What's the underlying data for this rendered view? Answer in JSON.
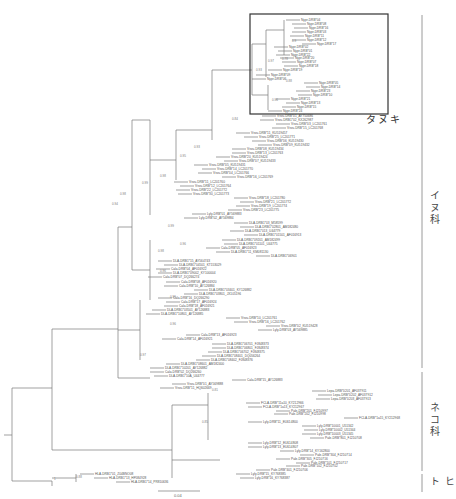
{
  "figure": {
    "type": "phylogenetic-tree",
    "highlight_box": {
      "label": "タヌキ",
      "x": 250,
      "y": 14,
      "w": 138,
      "h": 100
    },
    "groups": [
      {
        "label": "イヌ科",
        "y1": 15,
        "y2": 368,
        "label_y": 190
      },
      {
        "label": "ネコ科",
        "y1": 372,
        "y2": 471,
        "label_y": 402
      },
      {
        "label": "ヒト",
        "y1": 474,
        "y2": 492,
        "label_y": 476
      }
    ],
    "scale_bar": {
      "label": "0.04",
      "x1": 158,
      "x2": 200,
      "y": 491
    }
  },
  "leaves": [
    {
      "label": "Nypr-DRB*04",
      "x": 300,
      "y": 20
    },
    {
      "label": "Nypr-DRB*08",
      "x": 306,
      "y": 24
    },
    {
      "label": "Nypr-DRB*16",
      "x": 308,
      "y": 28
    },
    {
      "label": "Nypr-DRB*03",
      "x": 306,
      "y": 32
    },
    {
      "label": "Nypr-DRB*11",
      "x": 304,
      "y": 36
    },
    {
      "label": "Nypr-DRB*12",
      "x": 306,
      "y": 40
    },
    {
      "label": "Nypr-DRB*17",
      "x": 316,
      "y": 44
    },
    {
      "label": "Nypr-DRB*02",
      "x": 288,
      "y": 47
    },
    {
      "label": "Nypr-DRB*01",
      "x": 292,
      "y": 51
    },
    {
      "label": "Nypr-DRB*22",
      "x": 290,
      "y": 55
    },
    {
      "label": "Nypr-DRB*20",
      "x": 294,
      "y": 58
    },
    {
      "label": "Nypr-DRB*07",
      "x": 296,
      "y": 62
    },
    {
      "label": "Nypr-DRB*18",
      "x": 298,
      "y": 66
    },
    {
      "label": "Nypr-DRB*19",
      "x": 282,
      "y": 70
    },
    {
      "label": "Nypr-DRB*09",
      "x": 270,
      "y": 75
    },
    {
      "label": "Nypr-DRB*06",
      "x": 266,
      "y": 79
    },
    {
      "label": "Nypr-DRB*05",
      "x": 318,
      "y": 83
    },
    {
      "label": "Nypr-DRB*14",
      "x": 320,
      "y": 87
    },
    {
      "label": "Nypr-DRB*23",
      "x": 310,
      "y": 91
    },
    {
      "label": "Nypr-DRB*10",
      "x": 312,
      "y": 95
    },
    {
      "label": "Nypr-DRB*21",
      "x": 290,
      "y": 99
    },
    {
      "label": "Nypr-DRB*13",
      "x": 300,
      "y": 103
    },
    {
      "label": "Nypr-DRB*15",
      "x": 296,
      "y": 107
    },
    {
      "label": "Nypr-DRB*24",
      "x": 282,
      "y": 111
    },
    {
      "label": "Vvvu-DRB*01_AY750686",
      "x": 276,
      "y": 116
    },
    {
      "label": "Vvvu-DRB1*02_KX262987",
      "x": 274,
      "y": 120
    },
    {
      "label": "Vvvu-DRB*03_LC201761",
      "x": 290,
      "y": 124
    },
    {
      "label": "Vvvu-DRB*15_LC201768",
      "x": 286,
      "y": 128
    },
    {
      "label": "Vvvu-DRB*11_KU519457",
      "x": 250,
      "y": 133
    },
    {
      "label": "Vvvu-DRB*25_LC201771",
      "x": 258,
      "y": 137
    },
    {
      "label": "Vvvu-DRB*06_KU519430",
      "x": 266,
      "y": 141
    },
    {
      "label": "Vvvu-DRB*09_KU519432",
      "x": 272,
      "y": 145
    },
    {
      "label": "Vvvu-DRB*08_KU519434",
      "x": 246,
      "y": 149
    },
    {
      "label": "Vvvu-DRB*13_LC201763",
      "x": 246,
      "y": 153
    },
    {
      "label": "Vvvu-DRB*20_KU519424",
      "x": 230,
      "y": 157
    },
    {
      "label": "Vvvu-DRB*07_KU519433",
      "x": 238,
      "y": 161
    },
    {
      "label": "Vvvu-DRB*05_KU519431",
      "x": 208,
      "y": 165
    },
    {
      "label": "Vvvu-DRB*14_LC201770",
      "x": 216,
      "y": 169
    },
    {
      "label": "Vvvu-DRB*04_LC201766",
      "x": 212,
      "y": 173
    },
    {
      "label": "Vvvu-DRB*16_LC201769",
      "x": 236,
      "y": 177
    },
    {
      "label": "Vvvu-DRB*11_LC201760",
      "x": 188,
      "y": 182
    },
    {
      "label": "Vvvu-DRB*12_LC201764",
      "x": 194,
      "y": 186
    },
    {
      "label": "Vvvu-DRB*22_LC201772",
      "x": 190,
      "y": 190
    },
    {
      "label": "Vvvu-DRB*30_LC201773",
      "x": 192,
      "y": 194
    },
    {
      "label": "Vvvu-DRB*18_LC201780",
      "x": 248,
      "y": 198
    },
    {
      "label": "Vvvu-DRB*21_LC201772",
      "x": 254,
      "y": 202
    },
    {
      "label": "Vvvu-DRB*19_LC201774",
      "x": 250,
      "y": 206
    },
    {
      "label": "Vvvu-DRB*23_LC201775",
      "x": 242,
      "y": 210
    },
    {
      "label": "Lyly-DRB*01_AY569883",
      "x": 206,
      "y": 214
    },
    {
      "label": "Lyly-DRB*02_AY569884",
      "x": 198,
      "y": 218
    },
    {
      "label": "DLA-DRB1*03_M58599",
      "x": 248,
      "y": 223
    },
    {
      "label": "DLA-DRB1*02801_AM182480",
      "x": 254,
      "y": 227
    },
    {
      "label": "DLA-DRB1*013_U44779",
      "x": 244,
      "y": 231
    },
    {
      "label": "DLA-DRB1*01501_AF016913",
      "x": 258,
      "y": 235
    },
    {
      "label": "DLA-DRB1*09201_AM182499",
      "x": 236,
      "y": 240
    },
    {
      "label": "DLA-DRB1*01101_U44775",
      "x": 238,
      "y": 244
    },
    {
      "label": "Cala-DRB*05_AF016923",
      "x": 220,
      "y": 248
    },
    {
      "label": "DLA-DRB1*11_KM081130",
      "x": 230,
      "y": 252
    },
    {
      "label": "DLA-DRB1*06901",
      "x": 270,
      "y": 256
    },
    {
      "label": "DLA-DRB1*15_AY564743",
      "x": 172,
      "y": 261
    },
    {
      "label": "DLA-DRB1*04501_KT153029",
      "x": 178,
      "y": 265
    },
    {
      "label": "Cala-DRB*04_AF016922",
      "x": 170,
      "y": 269
    },
    {
      "label": "DLA-DRB1*09002_KY100004",
      "x": 172,
      "y": 273
    },
    {
      "label": "Cala-DRB*07_DQ266274",
      "x": 162,
      "y": 277
    },
    {
      "label": "Cala-DRB*08_AF016920",
      "x": 180,
      "y": 282
    },
    {
      "label": "Cala-DRB*10_AY126884",
      "x": 178,
      "y": 286
    },
    {
      "label": "DLA-DRB1*03401_KY126882",
      "x": 208,
      "y": 290
    },
    {
      "label": "DLA-DRB1*03801_JX105196",
      "x": 198,
      "y": 294
    },
    {
      "label": "Cala-DRB*16_DQ266290",
      "x": 172,
      "y": 298
    },
    {
      "label": "Cala-DRB*17_AF016924",
      "x": 180,
      "y": 302
    },
    {
      "label": "Cala-DRB*18_AF016921",
      "x": 178,
      "y": 306
    },
    {
      "label": "DLA-DRB1*03501_AY126883",
      "x": 166,
      "y": 310
    },
    {
      "label": "DLA-DRB1*10801_AY126885",
      "x": 160,
      "y": 314
    },
    {
      "label": "Vvvu-DRB*10_LC201761",
      "x": 240,
      "y": 318
    },
    {
      "label": "Vvvu-DRB*16_LC201762",
      "x": 248,
      "y": 322
    },
    {
      "label": "Vvvu-DRB*02_KU519428",
      "x": 280,
      "y": 326
    },
    {
      "label": "Lyly-DRB*03_AY569885",
      "x": 272,
      "y": 330
    },
    {
      "label": "Cala-DRB*13_AF016923",
      "x": 200,
      "y": 335
    },
    {
      "label": "Cala-DRB*14_AF016921",
      "x": 176,
      "y": 339
    },
    {
      "label": "DLA-DRB1*06701_FJ848373",
      "x": 226,
      "y": 344
    },
    {
      "label": "DLA-DRB1*06801_FJ848374",
      "x": 226,
      "y": 348
    },
    {
      "label": "DLA-DRB1*06702_FJ848375",
      "x": 222,
      "y": 352
    },
    {
      "label": "DLA-DRB1*08401_DQ056264",
      "x": 216,
      "y": 356
    },
    {
      "label": "DLA-DRB1*08402_FJ848376",
      "x": 210,
      "y": 360
    },
    {
      "label": "DLA-DRB1*08601_AM182400",
      "x": 180,
      "y": 364
    },
    {
      "label": "DLA-DRB1*10201_AY126882",
      "x": 164,
      "y": 368
    },
    {
      "label": "Cala-DRB*02_DQ266260",
      "x": 164,
      "y": 372
    },
    {
      "label": "DLA-DRB1*10A_U44777",
      "x": 168,
      "y": 376
    },
    {
      "label": "Cala-DRB*15_AY126883",
      "x": 246,
      "y": 380
    },
    {
      "label": "Vvvu-DRB*01_AY569888",
      "x": 186,
      "y": 384
    },
    {
      "label": "Vvvu-DRB*11_HQ602669",
      "x": 174,
      "y": 388
    },
    {
      "label": "Lepa-DRB*0201_AF037911",
      "x": 326,
      "y": 391
    },
    {
      "label": "Lepa-DRB*0202_AF037912",
      "x": 332,
      "y": 395
    },
    {
      "label": "Lepa-DRB*0203_AF037913",
      "x": 330,
      "y": 399
    },
    {
      "label": "FCLA-DRB*11a10_KY212966",
      "x": 260,
      "y": 403
    },
    {
      "label": "FCLA-DRB*1a13_KY212967",
      "x": 262,
      "y": 407
    },
    {
      "label": "Pale-DRB*201_FJ210997",
      "x": 290,
      "y": 411
    },
    {
      "label": "Pale-DRB*202_FJ210998",
      "x": 288,
      "y": 414
    },
    {
      "label": "FCLA-DRB*1a15_KY212968",
      "x": 358,
      "y": 418
    },
    {
      "label": "Lyly-DRB*11_EU614800",
      "x": 262,
      "y": 422
    },
    {
      "label": "Lyly-DRB*10001_U51342",
      "x": 316,
      "y": 426
    },
    {
      "label": "Lyly-DRB*10002_U51344",
      "x": 318,
      "y": 430
    },
    {
      "label": "Lyly-DRB*10003_U51345",
      "x": 316,
      "y": 434
    },
    {
      "label": "Pale-DRB*801_FJ210708",
      "x": 324,
      "y": 438
    },
    {
      "label": "Lyly-DRB*12_EU614808",
      "x": 262,
      "y": 443
    },
    {
      "label": "Lyly-DRB*13_EU614807",
      "x": 262,
      "y": 447
    },
    {
      "label": "Lyly-DRB*14_KY162800",
      "x": 294,
      "y": 451
    },
    {
      "label": "Pale-DRB*304_FJ210714",
      "x": 314,
      "y": 455
    },
    {
      "label": "Pale-DRB*305_FJ210716",
      "x": 290,
      "y": 459
    },
    {
      "label": "Pale-DRB*101_FJ210717",
      "x": 310,
      "y": 463
    },
    {
      "label": "Pale-DRB*102_FJ210702",
      "x": 300,
      "y": 466
    },
    {
      "label": "Pale-DRB*401_FJ210706",
      "x": 270,
      "y": 470
    },
    {
      "label": "Lyly-DRB*15_KY768385",
      "x": 250,
      "y": 474
    },
    {
      "label": "Lyly-DRB*16_KY768387",
      "x": 254,
      "y": 478
    },
    {
      "label": "HLA-DRB1*01_Z04BNO08",
      "x": 94,
      "y": 474
    },
    {
      "label": "HLA-DRB1*13_HF584928",
      "x": 108,
      "y": 478
    },
    {
      "label": "HLA-DRB1*14_PR810636",
      "x": 130,
      "y": 482
    }
  ],
  "bootstrap": [
    {
      "v": "0.93",
      "x": 256,
      "y": 71
    },
    {
      "v": "0.97",
      "x": 268,
      "y": 62
    },
    {
      "v": "0.78",
      "x": 282,
      "y": 60
    },
    {
      "v": "0.9",
      "x": 292,
      "y": 42
    },
    {
      "v": "0.88",
      "x": 286,
      "y": 82
    },
    {
      "v": "0.96",
      "x": 272,
      "y": 101
    },
    {
      "v": "0.84",
      "x": 232,
      "y": 120
    },
    {
      "v": "0.93",
      "x": 194,
      "y": 148
    },
    {
      "v": "0.95",
      "x": 180,
      "y": 157
    },
    {
      "v": "0.98",
      "x": 160,
      "y": 177
    },
    {
      "v": "0.99",
      "x": 142,
      "y": 184
    },
    {
      "v": "0.98",
      "x": 120,
      "y": 195
    },
    {
      "v": "0.94",
      "x": 112,
      "y": 205
    },
    {
      "v": "0.99",
      "x": 168,
      "y": 227
    },
    {
      "v": "0.96",
      "x": 180,
      "y": 245
    },
    {
      "v": "0.98",
      "x": 158,
      "y": 252
    },
    {
      "v": "0.96",
      "x": 160,
      "y": 272
    },
    {
      "v": "0.99",
      "x": 170,
      "y": 298
    },
    {
      "v": "0.96",
      "x": 170,
      "y": 325
    },
    {
      "v": "0.97",
      "x": 140,
      "y": 356
    },
    {
      "v": "0.81",
      "x": 212,
      "y": 391
    },
    {
      "v": "0.85",
      "x": 202,
      "y": 423
    },
    {
      "v": "0.88",
      "x": 76,
      "y": 478
    },
    {
      "v": "1",
      "x": 54,
      "y": 480
    }
  ]
}
